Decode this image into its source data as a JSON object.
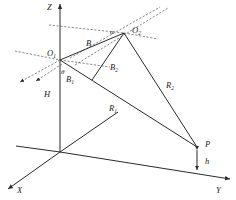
{
  "diagram": {
    "title": "",
    "axes": {
      "z_label": "Z",
      "x_label": "X",
      "y_label": "Y"
    },
    "points": {
      "o1": {
        "label": "O",
        "sub": "1"
      },
      "o2": {
        "label": "O",
        "sub": "2"
      },
      "p": {
        "label": "P"
      }
    },
    "segments": {
      "b": {
        "label": "B"
      },
      "b1": {
        "label": "B",
        "sub": "1"
      },
      "b2": {
        "label": "B",
        "sub": "2"
      },
      "r1": {
        "label": "R",
        "sub": "1"
      },
      "r2": {
        "label": "R",
        "sub": "2"
      },
      "H": {
        "label": "H"
      },
      "h": {
        "label": "h"
      }
    },
    "angles": {
      "alpha": {
        "label": "α"
      },
      "theta": {
        "label": "θ"
      }
    },
    "colors": {
      "line": "#2a2a2a",
      "dashed": "#555555",
      "text": "#222222",
      "background": "#ffffff"
    }
  }
}
